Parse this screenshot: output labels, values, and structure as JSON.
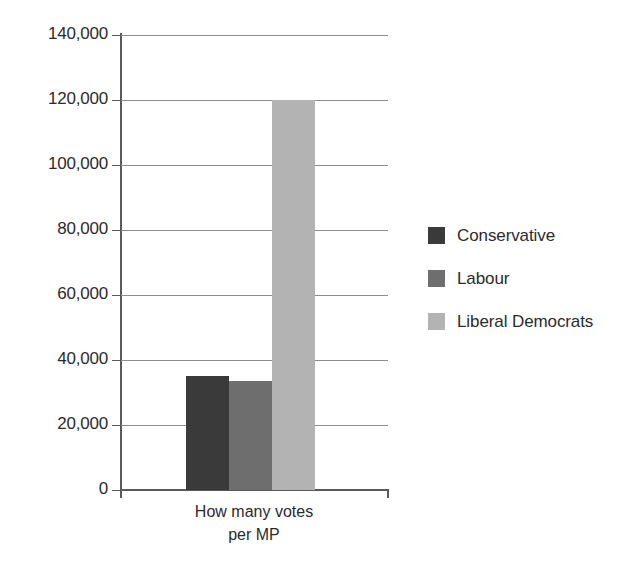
{
  "chart_data": {
    "type": "bar",
    "title": "",
    "subtitle": "",
    "xlabel": "How many votes per MP",
    "ylabel": "",
    "categories": [
      "How many votes per MP"
    ],
    "series": [
      {
        "name": "Conservative",
        "values": [
          35000
        ],
        "color": "#3a3a3a"
      },
      {
        "name": "Labour",
        "values": [
          33500
        ],
        "color": "#6e6e6e"
      },
      {
        "name": "Liberal Democrats",
        "values": [
          120000
        ],
        "color": "#b3b3b3"
      }
    ],
    "ylim": [
      0,
      140000
    ],
    "y_ticks": [
      0,
      20000,
      40000,
      60000,
      80000,
      100000,
      120000,
      140000
    ],
    "y_tick_labels": [
      "0",
      "20,000",
      "40,000",
      "60,000",
      "80,000",
      "100,000",
      "120,000",
      "140,000"
    ],
    "grid": true,
    "grid_axis": "y",
    "legend_position": "right",
    "legend_entries": [
      "Conservative",
      "Labour",
      "Liberal Democrats"
    ]
  },
  "axis": {
    "x_label_line1": "How many votes",
    "x_label_line2": "per MP"
  },
  "legend": {
    "items": [
      {
        "label": "Conservative",
        "color": "#3a3a3a"
      },
      {
        "label": "Labour",
        "color": "#6e6e6e"
      },
      {
        "label": "Liberal Democrats",
        "color": "#b3b3b3"
      }
    ]
  },
  "colors": {
    "axis": "#5a5a5a",
    "grid": "#8c8c8c",
    "text": "#2b2b2b",
    "background": "#ffffff"
  }
}
